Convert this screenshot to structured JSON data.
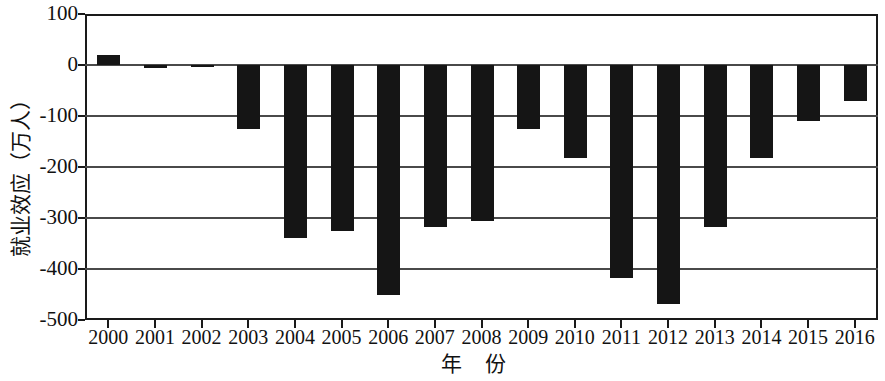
{
  "chart_data": {
    "type": "bar",
    "title": "",
    "subtitle": "",
    "xlabel": "年 份",
    "ylabel": "就业效应（万人）",
    "categories": [
      "2000",
      "2001",
      "2002",
      "2003",
      "2004",
      "2005",
      "2006",
      "2007",
      "2008",
      "2009",
      "2010",
      "2011",
      "2012",
      "2013",
      "2014",
      "2015",
      "2016"
    ],
    "values": [
      20,
      -5,
      -3,
      -125,
      -340,
      -325,
      -450,
      -318,
      -305,
      -125,
      -183,
      -418,
      -468,
      -318,
      -183,
      -110,
      -70
    ],
    "series": [
      {
        "name": "就业效应",
        "values": [
          20,
          -5,
          -3,
          -125,
          -340,
          -325,
          -450,
          -318,
          -305,
          -125,
          -183,
          -418,
          -468,
          -318,
          -183,
          -110,
          -70
        ]
      }
    ],
    "ylim": [
      -500,
      100
    ],
    "yticks": [
      100,
      0,
      -100,
      -200,
      -300,
      -400,
      -500
    ],
    "ytick_labels": [
      "100",
      "0",
      "-100",
      "-200",
      "-300",
      "-400",
      "-500"
    ],
    "xtick_labels": [
      "2000",
      "2001",
      "2002",
      "2003",
      "2004",
      "2005",
      "2006",
      "2007",
      "2008",
      "2009",
      "2010",
      "2011",
      "2012",
      "2013",
      "2014",
      "2015",
      "2016"
    ],
    "grid": true,
    "grid_axis": "y",
    "legend": "none",
    "bar_color": "#151515",
    "axis_color": "#1a1a1a",
    "grid_color": "#4a4a4a",
    "background": "#ffffff"
  },
  "axis": {
    "y_title": "就业效应（万人）",
    "x_title": "年 份"
  }
}
